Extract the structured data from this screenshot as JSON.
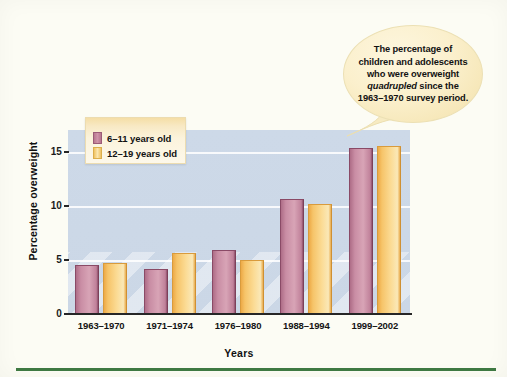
{
  "figure": {
    "background_color": "#fcfcf4",
    "rule_color": "#3f7a43"
  },
  "legend": {
    "items": [
      {
        "label": "6–11 years old",
        "color": "#c68ea4"
      },
      {
        "label": "12–19 years old",
        "color": "#f6c469"
      }
    ]
  },
  "callout": {
    "text_before": "The percentage of children and adolescents who were overweight ",
    "emphasis": "quadrupled",
    "text_after": " since the 1963–1970 survey period.",
    "full_text": "The percentage of children and adolescents who were overweight quadrupled since the 1963–1970 survey period.",
    "fill_color": "#f9eec6"
  },
  "axes": {
    "y_title": "Percentage overweight",
    "x_title": "Years",
    "y_ticks": [
      "0",
      "5",
      "10",
      "15"
    ],
    "y_tick_values": [
      0,
      5,
      10,
      15
    ]
  },
  "chart_data": {
    "type": "bar",
    "title": "",
    "subtitle": "",
    "xlabel": "Years",
    "ylabel": "Percentage overweight",
    "categories": [
      "1963–1970",
      "1971–1974",
      "1976–1980",
      "1988–1994",
      "1999–2002"
    ],
    "series": [
      {
        "name": "6–11 years old",
        "color": "#c68ea4",
        "values": [
          4.5,
          4.2,
          5.9,
          10.6,
          15.3
        ]
      },
      {
        "name": "12–19 years old",
        "color": "#f6c469",
        "values": [
          4.7,
          5.6,
          5.0,
          10.2,
          15.5
        ]
      }
    ],
    "ylim": [
      0,
      17
    ],
    "yticks": [
      0,
      5,
      10,
      15
    ],
    "grid": true,
    "grid_axis": "y",
    "legend_position": "upper-left-inside",
    "annotations": [
      {
        "type": "callout",
        "text": "The percentage of children and adolescents who were overweight quadrupled since the 1963–1970 survey period.",
        "points_at": "1999–2002"
      }
    ],
    "plot_background_color": "#ccd8e7"
  }
}
